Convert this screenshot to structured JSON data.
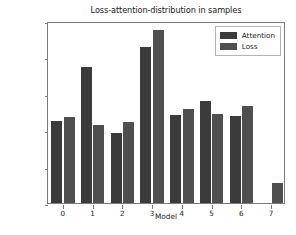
{
  "chart_data": {
    "type": "bar",
    "title": "Loss-attention-distribution in samples",
    "xlabel": "Model",
    "ylabel": "Samples",
    "categories": [
      "0",
      "1",
      "2",
      "3",
      "4",
      "5",
      "6",
      "7"
    ],
    "series": [
      {
        "name": "Attention",
        "color": "#3b3b3b",
        "values": [
          22600,
          37400,
          19100,
          42800,
          24200,
          28000,
          24000,
          0
        ]
      },
      {
        "name": "Loss",
        "color": "#4f4f4f",
        "values": [
          23700,
          21300,
          22300,
          47400,
          25900,
          24500,
          26600,
          5400
        ]
      }
    ],
    "ylim": [
      0,
      50000
    ],
    "yticks": [
      0,
      10000,
      20000,
      30000,
      40000,
      50000
    ],
    "ytick_labels": [
      "0",
      "10000",
      "20000",
      "30000",
      "40000",
      "50000"
    ],
    "xticks": [
      "0",
      "1",
      "2",
      "3",
      "4",
      "5",
      "6",
      "7"
    ],
    "grid": false,
    "legend_position": "upper right"
  }
}
